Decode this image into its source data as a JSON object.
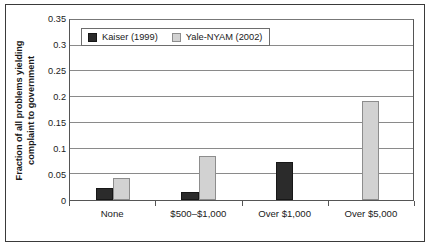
{
  "chart_data": {
    "type": "bar",
    "title": "",
    "xlabel": "",
    "ylabel": "Fraction of all problems yielding complaint to government",
    "ylabel_lines": [
      "Fraction of all problems yielding",
      "complaint to government"
    ],
    "categories": [
      "None",
      "$500–$1,000",
      "Over $1,000",
      "Over $5,000"
    ],
    "series": [
      {
        "name": "Kaiser (1999)",
        "color": "#2b2b2b",
        "values": [
          0.023,
          0.016,
          0.073,
          null
        ]
      },
      {
        "name": "Yale-NYAM (2002)",
        "color": "#d2d2d2",
        "values": [
          0.042,
          0.085,
          null,
          0.193
        ]
      }
    ],
    "ylim": [
      0,
      0.35
    ],
    "ytick_values": [
      0,
      0.05,
      0.1,
      0.15,
      0.2,
      0.25,
      0.3,
      0.35
    ],
    "ytick_labels": [
      "0",
      "0.05",
      "0.1",
      "0.15",
      "0.2",
      "0.25",
      "0.3",
      "0.35"
    ],
    "grid": "horizontal",
    "legend_position": "top-left-inside"
  }
}
